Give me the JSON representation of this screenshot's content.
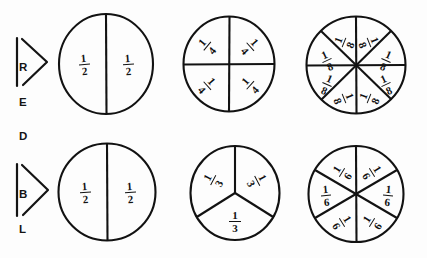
{
  "page": {
    "background_color": "#fdfdfd",
    "ink_color": "#121212"
  },
  "rows": [
    {
      "id": "red",
      "label": "RED",
      "label_letters": [
        "R",
        "E",
        "D"
      ],
      "circles": [
        {
          "name": "halves",
          "slices": 2,
          "fraction": "1/2",
          "numerator": "1",
          "denominator": "2",
          "labels": [
            "1/2",
            "1/2"
          ]
        },
        {
          "name": "fourths",
          "slices": 4,
          "fraction": "1/4",
          "numerator": "1",
          "denominator": "4",
          "labels": [
            "1/4",
            "1/4",
            "1/4",
            "1/4"
          ]
        },
        {
          "name": "eighths",
          "slices": 8,
          "fraction": "1/8",
          "numerator": "1",
          "denominator": "8",
          "labels": [
            "1/8",
            "1/8",
            "1/8",
            "1/8",
            "1/8",
            "1/8",
            "1/8",
            "1/8"
          ]
        }
      ]
    },
    {
      "id": "blue",
      "label": "BLUE",
      "label_letters": [
        "B",
        "L",
        "U",
        "E"
      ],
      "circles": [
        {
          "name": "halves",
          "slices": 2,
          "fraction": "1/2",
          "numerator": "1",
          "denominator": "2",
          "labels": [
            "1/2",
            "1/2"
          ]
        },
        {
          "name": "thirds",
          "slices": 3,
          "fraction": "1/3",
          "numerator": "1",
          "denominator": "3",
          "labels": [
            "1/3",
            "1/3",
            "1/3"
          ]
        },
        {
          "name": "sixths",
          "slices": 6,
          "fraction": "1/6",
          "numerator": "1",
          "denominator": "6",
          "labels": [
            "1/6",
            "1/6",
            "1/6",
            "1/6",
            "1/6",
            "1/6"
          ]
        }
      ]
    }
  ]
}
